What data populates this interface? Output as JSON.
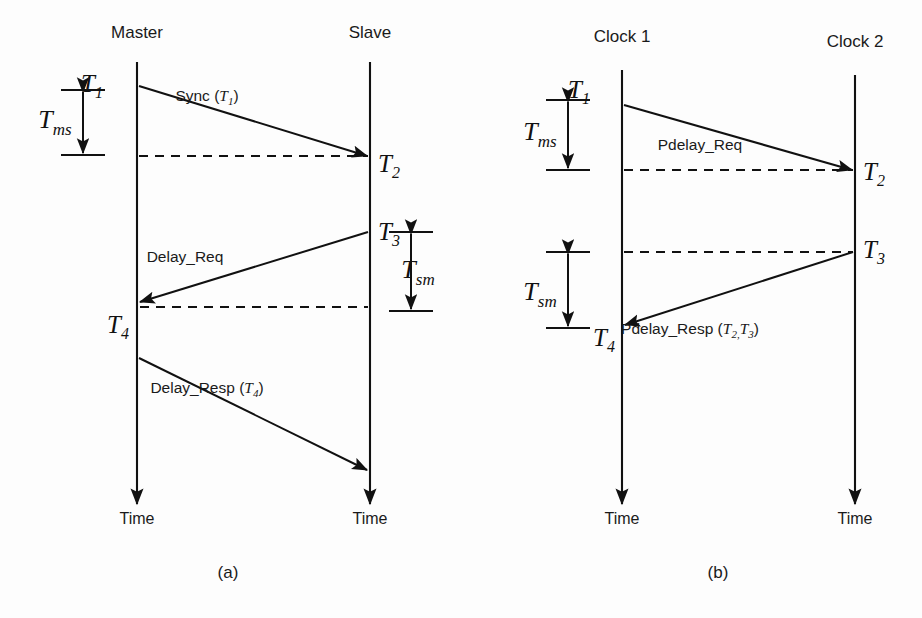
{
  "figure": {
    "title_alt": "PTP message exchange timing diagrams",
    "background_color": "#fdfdfd",
    "line_color": "#111111"
  },
  "panels": [
    {
      "id": "a",
      "caption": "(a)",
      "caption_x": 228,
      "caption_y": 578,
      "lifelines": [
        {
          "name": "master",
          "header": "Master",
          "header_x": 137,
          "header_y": 38,
          "x": 137,
          "y_top": 62,
          "y_bottom": 504,
          "time_label": "Time",
          "time_label_y": 524
        },
        {
          "name": "slave",
          "header": "Slave",
          "header_x": 370,
          "header_y": 38,
          "x": 370,
          "y_top": 62,
          "y_bottom": 504,
          "time_label": "Time",
          "time_label_y": 524
        }
      ],
      "timestamps": [
        {
          "id": "T1",
          "base": "T",
          "sub": "1",
          "x": 103,
          "y": 92,
          "anchor": "end"
        },
        {
          "id": "T2",
          "base": "T",
          "sub": "2",
          "x": 378,
          "y": 172,
          "anchor": "start"
        },
        {
          "id": "T3",
          "base": "T",
          "sub": "3",
          "x": 378,
          "y": 240,
          "anchor": "start"
        },
        {
          "id": "T4",
          "base": "T",
          "sub": "4",
          "x": 129,
          "y": 333,
          "anchor": "end"
        }
      ],
      "messages": [
        {
          "name": "sync",
          "label": "Sync (",
          "label_ts": "T",
          "label_ts_sub": "1",
          "label_tail": ")",
          "label_x": 207,
          "label_y": 101,
          "x1": 139,
          "y1": 86,
          "x2": 367,
          "y2": 156
        },
        {
          "name": "delay-req",
          "label": "Delay_Req",
          "label_ts": "",
          "label_ts_sub": "",
          "label_tail": "",
          "label_x": 185,
          "label_y": 262,
          "x1": 368,
          "y1": 232,
          "x2": 140,
          "y2": 302
        },
        {
          "name": "delay-resp",
          "label": "Delay_Resp (",
          "label_ts": "T",
          "label_ts_sub": "4",
          "label_tail": ")",
          "label_x": 207,
          "label_y": 393,
          "x1": 139,
          "y1": 358,
          "x2": 367,
          "y2": 470
        }
      ],
      "dashed_lines": [
        {
          "name": "t2-projection",
          "x1": 139,
          "y1": 156,
          "x2": 368,
          "y2": 156
        },
        {
          "name": "t4-projection",
          "x1": 140,
          "y1": 307,
          "x2": 368,
          "y2": 307
        }
      ],
      "intervals": [
        {
          "name": "Tms",
          "base": "T",
          "sub": "ms",
          "label_x": 55,
          "label_y": 128,
          "axis_x": 83,
          "y_top": 90,
          "y_bottom": 155,
          "tick_half_width": 22
        },
        {
          "name": "Tsm",
          "base": "T",
          "sub": "sm",
          "label_x": 418,
          "label_y": 278,
          "axis_x": 411,
          "y_top": 232,
          "y_bottom": 311,
          "tick_half_width": 22
        }
      ]
    },
    {
      "id": "b",
      "caption": "(b)",
      "caption_x": 718,
      "caption_y": 578,
      "lifelines": [
        {
          "name": "clock-1",
          "header": "Clock 1",
          "header_x": 622,
          "header_y": 42,
          "x": 622,
          "y_top": 70,
          "y_bottom": 504,
          "time_label": "Time",
          "time_label_y": 524
        },
        {
          "name": "clock-2",
          "header": "Clock 2",
          "header_x": 855,
          "header_y": 47,
          "x": 855,
          "y_top": 75,
          "y_bottom": 504,
          "time_label": "Time",
          "time_label_y": 524
        }
      ],
      "timestamps": [
        {
          "id": "T1",
          "base": "T",
          "sub": "1",
          "x": 590,
          "y": 98,
          "anchor": "end"
        },
        {
          "id": "T2",
          "base": "T",
          "sub": "2",
          "x": 863,
          "y": 180,
          "anchor": "start"
        },
        {
          "id": "T3",
          "base": "T",
          "sub": "3",
          "x": 863,
          "y": 258,
          "anchor": "start"
        },
        {
          "id": "T4",
          "base": "T",
          "sub": "4",
          "x": 615,
          "y": 346,
          "anchor": "end"
        }
      ],
      "messages": [
        {
          "name": "pdelay-req",
          "label": "Pdelay_Req",
          "label_ts": "",
          "label_ts_sub": "",
          "label_tail": "",
          "label_x": 700,
          "label_y": 150,
          "x1": 624,
          "y1": 105,
          "x2": 852,
          "y2": 170
        },
        {
          "name": "pdelay-resp",
          "label": "Pdelay_Resp (",
          "label_ts": "T",
          "label_ts_sub": "2,",
          "label_ts2": "T",
          "label_ts2_sub": "3",
          "label_tail": ")",
          "label_x": 690,
          "label_y": 334,
          "x1": 853,
          "y1": 252,
          "x2": 625,
          "y2": 325
        }
      ],
      "dashed_lines": [
        {
          "name": "t2-projection",
          "x1": 624,
          "y1": 170,
          "x2": 853,
          "y2": 170
        },
        {
          "name": "t3-projection",
          "x1": 624,
          "y1": 252,
          "x2": 853,
          "y2": 252
        }
      ],
      "intervals": [
        {
          "name": "Tms",
          "base": "T",
          "sub": "ms",
          "label_x": 540,
          "label_y": 140,
          "axis_x": 568,
          "y_top": 100,
          "y_bottom": 170,
          "tick_half_width": 22
        },
        {
          "name": "Tsm",
          "base": "T",
          "sub": "sm",
          "label_x": 540,
          "label_y": 300,
          "axis_x": 568,
          "y_top": 252,
          "y_bottom": 328,
          "tick_half_width": 22
        }
      ]
    }
  ]
}
